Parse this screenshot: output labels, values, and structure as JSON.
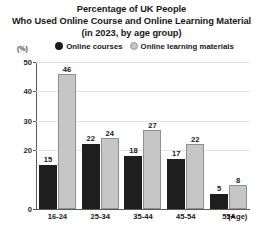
{
  "title": {
    "line1": "Percentage of UK People",
    "line2": "Who Used Online Course and Online Learning Material",
    "line3": "(in 2023, by age group)"
  },
  "axis": {
    "unit": "(%)",
    "x_axis_name": "(Age)"
  },
  "legend": {
    "items": [
      {
        "label": "Online courses",
        "color": "#1e1e1e"
      },
      {
        "label": "Online learning materials",
        "color": "#c6c6c6"
      }
    ]
  },
  "yticks": [
    {
      "label": "50",
      "value": 50
    },
    {
      "label": "40",
      "value": 40
    },
    {
      "label": "30",
      "value": 30
    },
    {
      "label": "20",
      "value": 20
    },
    {
      "label": "0",
      "value": 0
    }
  ],
  "groups": [
    {
      "category": "16-24",
      "courses": 15,
      "materials": 46
    },
    {
      "category": "25-34",
      "courses": 22,
      "materials": 24
    },
    {
      "category": "35-44",
      "courses": 18,
      "materials": 27
    },
    {
      "category": "45-54",
      "courses": 17,
      "materials": 22
    },
    {
      "category": "55+",
      "courses": 5,
      "materials": 8
    }
  ],
  "chart_data": {
    "type": "bar",
    "title": "Percentage of UK People Who Used Online Course and Online Learning Material (in 2023, by age group)",
    "subtitle": "(in 2023, by age group)",
    "xlabel": "(Age)",
    "ylabel": "(%)",
    "ylim": [
      0,
      50
    ],
    "ytick_values": [
      0,
      20,
      30,
      40,
      50
    ],
    "grid": true,
    "legend_position": "top-center",
    "categories": [
      "16-24",
      "25-34",
      "35-44",
      "45-54",
      "55+"
    ],
    "series": [
      {
        "name": "Online courses",
        "color": "#1e1e1e",
        "values": [
          15,
          22,
          18,
          17,
          5
        ]
      },
      {
        "name": "Online learning materials",
        "color": "#c6c6c6",
        "values": [
          46,
          24,
          27,
          22,
          8
        ]
      }
    ]
  }
}
